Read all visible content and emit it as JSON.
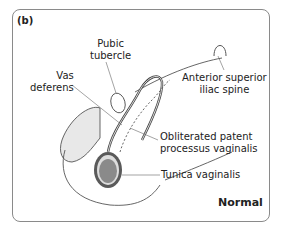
{
  "panel_label": "(b)",
  "condition_label": "Normal",
  "labels": {
    "pubic_tubercle": [
      "Pubic",
      "tubercle"
    ],
    "vas_deferens": [
      "Vas",
      "deferens"
    ],
    "asis": [
      "Anterior superior",
      "iliac spine"
    ],
    "obliterated": [
      "Obliterated patent",
      "processus vaginalis"
    ],
    "tunica": "Tunica vaginalis"
  },
  "colors": {
    "outline": "#555555",
    "skin_fill": "#e8e8e8",
    "testis_fill": "#8a8a8a",
    "tunica_ring": "#5a5a5a"
  }
}
